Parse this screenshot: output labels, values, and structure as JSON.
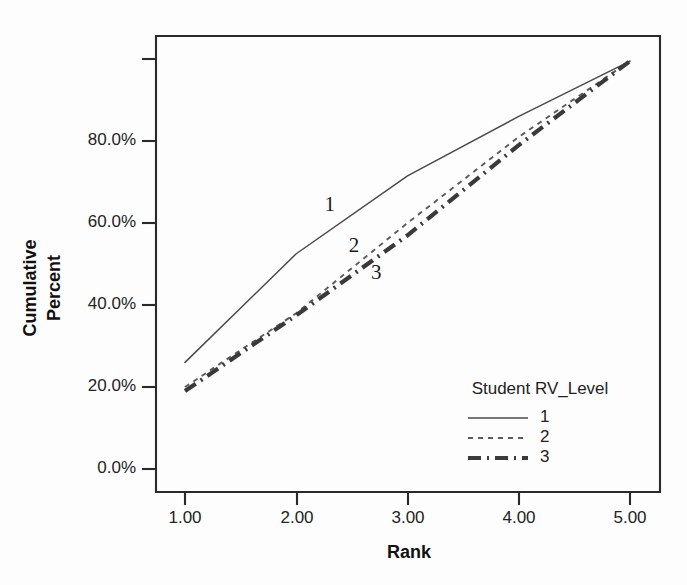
{
  "chart_data": {
    "type": "line",
    "title": "",
    "subtitle": "",
    "xlabel": "Rank",
    "ylabel": "Cumulative Percent",
    "ylabel_lines": [
      "Cumulative",
      "Percent"
    ],
    "x": [
      1.0,
      2.0,
      3.0,
      4.0,
      5.0
    ],
    "xtick_labels": [
      "1.00",
      "2.00",
      "3.00",
      "4.00",
      "5.00"
    ],
    "ytick_labels": [
      "0.0%",
      "20.0%",
      "40.0%",
      "60.0%",
      "80.0%"
    ],
    "ytick_values": [
      0.0,
      20.0,
      40.0,
      60.0,
      80.0
    ],
    "xlim": [
      0.78,
      5.22
    ],
    "ylim": [
      -5.0,
      105.0
    ],
    "grid": false,
    "units": "percent",
    "legend_position": "inside-bottom-right",
    "legend_title": "Student RV_Level",
    "series": [
      {
        "name": "1",
        "legend_label": "1",
        "style": "solid",
        "inline_label": "1",
        "values": [
          26.0,
          52.5,
          71.5,
          86.0,
          99.5
        ]
      },
      {
        "name": "2",
        "legend_label": "2",
        "style": "dashed",
        "inline_label": "2",
        "values": [
          20.0,
          38.0,
          60.0,
          81.0,
          99.5
        ]
      },
      {
        "name": "3",
        "legend_label": "3",
        "style": "dash-dot",
        "inline_label": "3",
        "values": [
          19.0,
          37.5,
          57.0,
          79.0,
          99.5
        ]
      }
    ],
    "inline_labels": [
      {
        "text": "1",
        "x": 2.3,
        "y": 64.0
      },
      {
        "text": "2",
        "x": 2.52,
        "y": 54.0
      },
      {
        "text": "3",
        "x": 2.72,
        "y": 47.5
      }
    ],
    "colors": {
      "axis": "#2a2a2a",
      "text": "#232323",
      "series_1": "#4a4a4a",
      "series_2": "#5a5a5a",
      "series_3": "#3a3a3a",
      "background": "#fdfdfd"
    }
  },
  "legend": {
    "title": "Student RV_Level",
    "entries": [
      {
        "label": "1"
      },
      {
        "label": "2"
      },
      {
        "label": "3"
      }
    ]
  },
  "axes": {
    "x_title": "Rank",
    "y_title_line1": "Cumulative",
    "y_title_line2": "Percent",
    "x_ticks": [
      "1.00",
      "2.00",
      "3.00",
      "4.00",
      "5.00"
    ],
    "y_ticks": [
      "0.0%",
      "20.0%",
      "40.0%",
      "60.0%",
      "80.0%"
    ]
  }
}
